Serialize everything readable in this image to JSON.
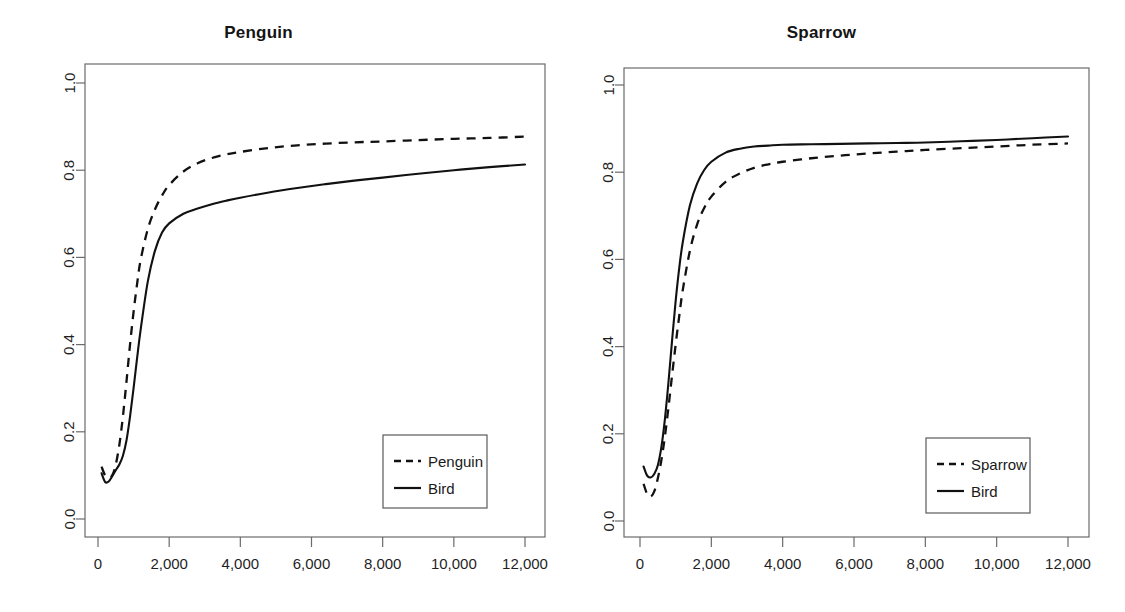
{
  "figure": {
    "background": "#ffffff",
    "line_color": "#111111",
    "axis_color": "#6b6b6b",
    "panel_count": 2
  },
  "chart_data": [
    {
      "type": "line",
      "title": "Penguin",
      "xlabel": "",
      "ylabel": "",
      "xlim": [
        -300,
        12600
      ],
      "ylim": [
        -0.03,
        1.03
      ],
      "xticks": [
        0,
        2000,
        4000,
        6000,
        8000,
        10000,
        12000
      ],
      "xticklabels": [
        "0",
        "2,000",
        "4,000",
        "6,000",
        "8,000",
        "10,000",
        "12,000"
      ],
      "yticks": [
        0.0,
        0.2,
        0.4,
        0.6,
        0.8,
        1.0
      ],
      "yticklabels": [
        "0.0",
        "0.2",
        "0.4",
        "0.6",
        "0.8",
        "1.0"
      ],
      "grid": false,
      "legend_position": "bottom-right",
      "series": [
        {
          "name": "Penguin",
          "style": "dashed",
          "x": [
            100,
            200,
            300,
            400,
            500,
            600,
            700,
            800,
            900,
            1000,
            1100,
            1200,
            1400,
            1600,
            1800,
            2000,
            2400,
            2800,
            3200,
            3600,
            4000,
            4800,
            5600,
            6400,
            7200,
            8000,
            9000,
            10000,
            11000,
            12000
          ],
          "y": [
            0.12,
            0.1,
            0.095,
            0.1,
            0.125,
            0.17,
            0.235,
            0.315,
            0.4,
            0.475,
            0.54,
            0.595,
            0.665,
            0.71,
            0.742,
            0.766,
            0.797,
            0.816,
            0.828,
            0.836,
            0.842,
            0.851,
            0.857,
            0.861,
            0.864,
            0.866,
            0.869,
            0.872,
            0.874,
            0.877
          ]
        },
        {
          "name": "Bird",
          "style": "solid",
          "x": [
            100,
            200,
            300,
            400,
            500,
            600,
            700,
            800,
            900,
            1000,
            1100,
            1200,
            1400,
            1600,
            1800,
            2000,
            2400,
            2800,
            3200,
            3600,
            4000,
            4800,
            5600,
            6400,
            7200,
            8000,
            9000,
            10000,
            11000,
            12000
          ],
          "y": [
            0.105,
            0.085,
            0.086,
            0.098,
            0.112,
            0.125,
            0.145,
            0.18,
            0.235,
            0.3,
            0.37,
            0.435,
            0.545,
            0.615,
            0.657,
            0.678,
            0.7,
            0.712,
            0.722,
            0.73,
            0.737,
            0.749,
            0.759,
            0.768,
            0.776,
            0.783,
            0.792,
            0.8,
            0.807,
            0.813
          ]
        }
      ],
      "legend": [
        {
          "label": "Penguin",
          "style": "dashed"
        },
        {
          "label": "Bird",
          "style": "solid"
        }
      ]
    },
    {
      "type": "line",
      "title": "Sparrow",
      "xlabel": "",
      "ylabel": "",
      "xlim": [
        -300,
        12600
      ],
      "ylim": [
        -0.03,
        1.03
      ],
      "xticks": [
        0,
        2000,
        4000,
        6000,
        8000,
        10000,
        12000
      ],
      "xticklabels": [
        "0",
        "2,000",
        "4,000",
        "6,000",
        "8,000",
        "10,000",
        "12,000"
      ],
      "yticks": [
        0.0,
        0.2,
        0.4,
        0.6,
        0.8,
        1.0
      ],
      "yticklabels": [
        "0.0",
        "0.2",
        "0.4",
        "0.6",
        "0.8",
        "1.0"
      ],
      "grid": false,
      "legend_position": "bottom-right",
      "series": [
        {
          "name": "Sparrow",
          "style": "dashed",
          "x": [
            100,
            200,
            300,
            400,
            500,
            600,
            700,
            800,
            900,
            1000,
            1100,
            1200,
            1400,
            1600,
            1800,
            2000,
            2400,
            2800,
            3200,
            3600,
            4000,
            4800,
            5600,
            6400,
            7200,
            8000,
            9000,
            10000,
            11000,
            12000
          ],
          "y": [
            0.085,
            0.062,
            0.056,
            0.068,
            0.098,
            0.14,
            0.195,
            0.262,
            0.335,
            0.405,
            0.47,
            0.53,
            0.62,
            0.68,
            0.718,
            0.744,
            0.778,
            0.797,
            0.81,
            0.818,
            0.824,
            0.832,
            0.838,
            0.843,
            0.847,
            0.851,
            0.855,
            0.859,
            0.863,
            0.866
          ]
        },
        {
          "name": "Bird",
          "style": "solid",
          "x": [
            100,
            200,
            300,
            400,
            500,
            600,
            700,
            800,
            900,
            1000,
            1100,
            1200,
            1400,
            1600,
            1800,
            2000,
            2400,
            2800,
            3200,
            3600,
            4000,
            4800,
            5600,
            6400,
            7200,
            8000,
            9000,
            10000,
            11000,
            12000
          ],
          "y": [
            0.125,
            0.104,
            0.1,
            0.108,
            0.128,
            0.17,
            0.235,
            0.32,
            0.415,
            0.505,
            0.58,
            0.64,
            0.724,
            0.774,
            0.805,
            0.824,
            0.845,
            0.854,
            0.859,
            0.861,
            0.863,
            0.864,
            0.865,
            0.866,
            0.867,
            0.868,
            0.871,
            0.874,
            0.878,
            0.882
          ]
        }
      ],
      "legend": [
        {
          "label": "Sparrow",
          "style": "dashed"
        },
        {
          "label": "Bird",
          "style": "solid"
        }
      ]
    }
  ]
}
